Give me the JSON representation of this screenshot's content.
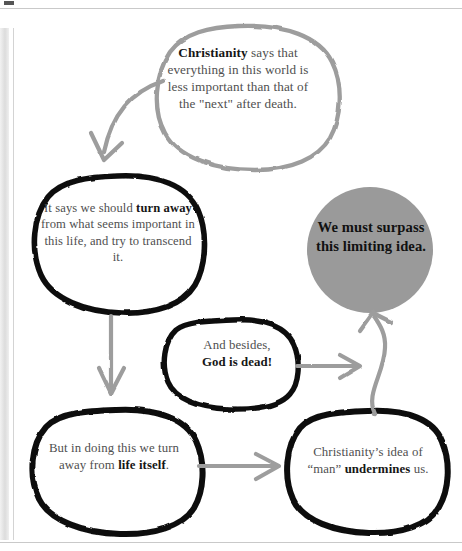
{
  "page": {
    "domain": "diagram",
    "background_color": "#ffffff",
    "scan_artifacts": {
      "left_gutter_band": true,
      "top_rule": true,
      "bottom_rule": true,
      "left_vertical_rule": true
    }
  },
  "palette": {
    "ink_black": "#111111",
    "ink_gray": "#9a9a9a",
    "arrow_gray": "#9d9d9d",
    "fill_gray": "#9a9a9a",
    "body_text": "#4f4f4f",
    "bold_text": "#161616",
    "paper": "#ffffff"
  },
  "diagram": {
    "type": "flow-of-bubbles",
    "title": "",
    "nodes": [
      {
        "id": "christianity",
        "name": "christianity-bubble",
        "outline": "gray",
        "filled": false,
        "text_runs": [
          {
            "text": "Christianity",
            "bold": true
          },
          {
            "text": " says that everything in this world is less important than that of the \"next\" after death.",
            "bold": false
          }
        ],
        "plain_text": "Christianity says that everything in this world is less important than that of the \"next\" after death."
      },
      {
        "id": "turn-away",
        "name": "turn-away-bubble",
        "outline": "black",
        "filled": false,
        "text_runs": [
          {
            "text": "It says we should ",
            "bold": false
          },
          {
            "text": "turn away",
            "bold": true
          },
          {
            "text": " from what seems important in this life, and try to transcend it.",
            "bold": false
          }
        ],
        "plain_text": "It says we should turn away from what seems important in this life, and try to transcend it."
      },
      {
        "id": "surpass",
        "name": "surpass-circle",
        "outline": "none",
        "filled": true,
        "fill_color": "#9a9a9a",
        "text_runs": [
          {
            "text": "We must surpass this limiting idea.",
            "bold": true
          }
        ],
        "plain_text": "We must surpass this limiting idea."
      },
      {
        "id": "god-is-dead",
        "name": "god-is-dead-bubble",
        "outline": "black",
        "filled": false,
        "text_runs": [
          {
            "text": "And besides, ",
            "bold": false
          },
          {
            "text": "God is dead!",
            "bold": true
          }
        ],
        "plain_text": "And besides, God is dead!"
      },
      {
        "id": "life-itself",
        "name": "life-itself-bubble",
        "outline": "black",
        "filled": false,
        "text_runs": [
          {
            "text": "But in doing this we turn away from ",
            "bold": false
          },
          {
            "text": "life itself",
            "bold": true
          },
          {
            "text": ".",
            "bold": false
          }
        ],
        "plain_text": "But in doing this we turn away from life itself."
      },
      {
        "id": "undermines",
        "name": "undermines-bubble",
        "outline": "black",
        "filled": false,
        "text_runs": [
          {
            "text": "Christianity’s idea of “man” ",
            "bold": false
          },
          {
            "text": "undermines",
            "bold": true
          },
          {
            "text": " us.",
            "bold": false
          }
        ],
        "plain_text": "Christianity’s idea of “man” undermines us."
      }
    ],
    "arrows": [
      {
        "id": "a1",
        "name": "arrow-christianity-to-turn-away",
        "from": "christianity",
        "to": "turn-away",
        "style": "curved",
        "color": "#9d9d9d"
      },
      {
        "id": "a2",
        "name": "arrow-turn-away-to-life-itself",
        "from": "turn-away",
        "to": "life-itself",
        "style": "straight-down",
        "color": "#9d9d9d"
      },
      {
        "id": "a3",
        "name": "arrow-life-itself-to-undermines",
        "from": "life-itself",
        "to": "undermines",
        "style": "straight-right",
        "color": "#9d9d9d"
      },
      {
        "id": "a4",
        "name": "arrow-god-is-dead-to-surpass",
        "from": "god-is-dead",
        "to": "surpass",
        "style": "straight-right",
        "color": "#9d9d9d"
      },
      {
        "id": "a5",
        "name": "arrow-undermines-to-surpass",
        "from": "undermines",
        "to": "surpass",
        "style": "curved-up",
        "color": "#9d9d9d"
      }
    ]
  },
  "text": {
    "christianity": {
      "bold_lead": "Christianity",
      "rest": " says that everything in this world is less important than that of the \"next\" after death."
    },
    "turn_away": {
      "pre": "It says we should ",
      "bold": "turn away",
      "post": " from what seems important in this life, and try to transcend it."
    },
    "surpass": {
      "all": "We must surpass this limiting idea."
    },
    "god_is_dead": {
      "pre": "And besides,",
      "bold": "God is dead!"
    },
    "life_itself": {
      "pre": "But in doing this we turn away from ",
      "bold": "life itself",
      "post": "."
    },
    "undermines": {
      "pre": "Christianity’s idea of “man” ",
      "bold": "undermines",
      "post": " us."
    }
  }
}
